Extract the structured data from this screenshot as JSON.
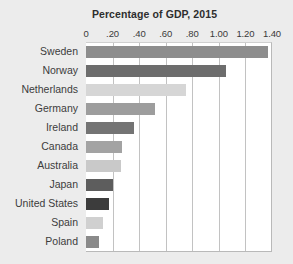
{
  "chart_data": {
    "type": "bar",
    "orientation": "horizontal",
    "title": "Percentage of GDP, 2015",
    "xlabel": "",
    "ylabel": "",
    "xlim": [
      0,
      1.4
    ],
    "xticks": [
      "0",
      ".20",
      ".40",
      ".60",
      ".80",
      "1.00",
      "1.20",
      "1.40"
    ],
    "xtick_values": [
      0,
      0.2,
      0.4,
      0.6,
      0.8,
      1.0,
      1.2,
      1.4
    ],
    "grid": "vertical",
    "legend": "none",
    "categories": [
      "Sweden",
      "Norway",
      "Netherlands",
      "Germany",
      "Ireland",
      "Canada",
      "Australia",
      "Japan",
      "United States",
      "Spain",
      "Poland"
    ],
    "values": [
      1.37,
      1.05,
      0.75,
      0.52,
      0.36,
      0.27,
      0.26,
      0.2,
      0.17,
      0.13,
      0.1
    ],
    "bar_colors": [
      "#8d8d8d",
      "#6d6d6d",
      "#d6d6d6",
      "#9d9d9d",
      "#747474",
      "#a3a3a3",
      "#c9c9c9",
      "#5d5d5d",
      "#3c3c3c",
      "#d0d0d0",
      "#8a8a8a"
    ],
    "background_color": "#ececec",
    "plot_background_color": "#ffffff",
    "gridline_color": "#c2c2c2"
  }
}
